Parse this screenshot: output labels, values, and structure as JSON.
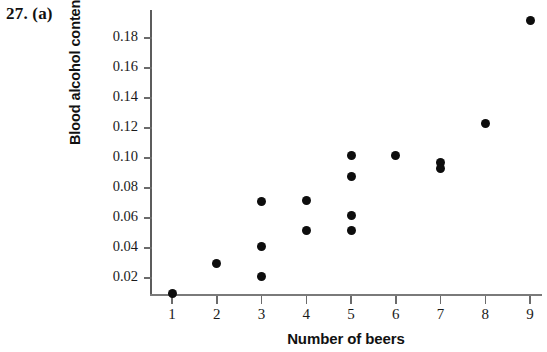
{
  "problem_label": "27. (a)",
  "chart_data": {
    "type": "scatter",
    "title": "",
    "xlabel": "Number of beers",
    "ylabel": "Blood alcohol content",
    "xlim": [
      0.5,
      9.4
    ],
    "ylim": [
      0.0,
      0.2
    ],
    "xticks": [
      1,
      2,
      3,
      4,
      5,
      6,
      7,
      8,
      9
    ],
    "xtick_labels": [
      "1",
      "2",
      "3",
      "4",
      "5",
      "6",
      "7",
      "8",
      "9"
    ],
    "yticks": [
      0.02,
      0.04,
      0.06,
      0.08,
      0.1,
      0.12,
      0.14,
      0.16,
      0.18
    ],
    "ytick_labels": [
      "0.02",
      "0.04",
      "0.06",
      "0.08",
      "0.10",
      "0.12",
      "0.14",
      "0.16",
      "0.18"
    ],
    "grid": false,
    "legend": null,
    "marker": "filled-circle",
    "marker_color": "#0d0d0d",
    "axis_color": "#6b6b6b",
    "points": [
      {
        "x": 1,
        "y": 0.01
      },
      {
        "x": 2,
        "y": 0.03
      },
      {
        "x": 3,
        "y": 0.071
      },
      {
        "x": 3,
        "y": 0.041
      },
      {
        "x": 3,
        "y": 0.021
      },
      {
        "x": 4,
        "y": 0.072
      },
      {
        "x": 4,
        "y": 0.052
      },
      {
        "x": 5,
        "y": 0.102
      },
      {
        "x": 5,
        "y": 0.088
      },
      {
        "x": 5,
        "y": 0.062
      },
      {
        "x": 5,
        "y": 0.052
      },
      {
        "x": 6,
        "y": 0.102
      },
      {
        "x": 7,
        "y": 0.097
      },
      {
        "x": 7,
        "y": 0.093
      },
      {
        "x": 8,
        "y": 0.123
      },
      {
        "x": 9,
        "y": 0.192
      }
    ]
  }
}
